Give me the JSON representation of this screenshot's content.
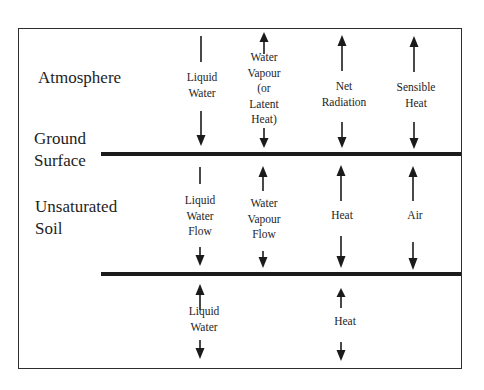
{
  "diagram": {
    "zones": {
      "atmosphere": "Atmosphere",
      "ground_surface_line1": "Ground",
      "ground_surface_line2": "Surface",
      "unsaturated_soil_line1": "Unsaturated",
      "unsaturated_soil_line2": "Soil"
    },
    "atmosphere_fluxes": [
      {
        "label_lines": [
          "Liquid",
          "Water"
        ],
        "direction": "down"
      },
      {
        "label_lines": [
          "Water",
          "Vapour",
          "(or",
          "Latent",
          "Heat)"
        ],
        "direction": "up-and-down"
      },
      {
        "label_lines": [
          "Net",
          "Radiation"
        ],
        "direction": "up-and-down"
      },
      {
        "label_lines": [
          "Sensible",
          "Heat"
        ],
        "direction": "up-and-down"
      }
    ],
    "soil_fluxes": [
      {
        "label_lines": [
          "Liquid",
          "Water",
          "Flow"
        ],
        "direction": "down"
      },
      {
        "label_lines": [
          "Water",
          "Vapour",
          "Flow"
        ],
        "direction": "up-and-down"
      },
      {
        "label_lines": [
          "Heat"
        ],
        "direction": "up-and-down"
      },
      {
        "label_lines": [
          "Air"
        ],
        "direction": "up-and-down"
      }
    ],
    "lower_fluxes": [
      {
        "label_lines": [
          "Liquid",
          "Water"
        ],
        "direction": "up-and-down"
      },
      {
        "label_lines": [
          "Heat"
        ],
        "direction": "up-and-down"
      }
    ],
    "colors": {
      "line": "#1b1b1b",
      "frame": "#2e2e2e",
      "text": "#1e1e1e",
      "background": "#ffffff"
    }
  }
}
